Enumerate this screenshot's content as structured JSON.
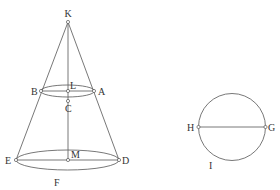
{
  "figure": {
    "cone": {
      "apex": {
        "label": "K",
        "x": 68,
        "y": 22
      },
      "upper_section": {
        "center": {
          "label": "L",
          "x": 68,
          "y": 92
        },
        "left": {
          "label": "B",
          "x": 41,
          "y": 91
        },
        "right": {
          "label": "A",
          "x": 94,
          "y": 91
        },
        "rx": 27,
        "ry": 6
      },
      "axis_point": {
        "label": "C",
        "x": 68,
        "y": 101
      },
      "base": {
        "center": {
          "label": "M",
          "x": 68,
          "y": 160
        },
        "left": {
          "label": "E",
          "x": 16,
          "y": 160
        },
        "right": {
          "label": "D",
          "x": 119,
          "y": 160
        },
        "rx": 51.5,
        "ry": 10,
        "arc_label": "F"
      }
    },
    "circle": {
      "cx": 232,
      "cy": 127,
      "r": 33.5,
      "left": {
        "label": "H",
        "x": 198.5,
        "y": 127
      },
      "right": {
        "label": "G",
        "x": 265.5,
        "y": 127
      },
      "arc_label": "I"
    },
    "colors": {
      "stroke": "#555555",
      "text": "#333333",
      "background": "#ffffff"
    }
  }
}
